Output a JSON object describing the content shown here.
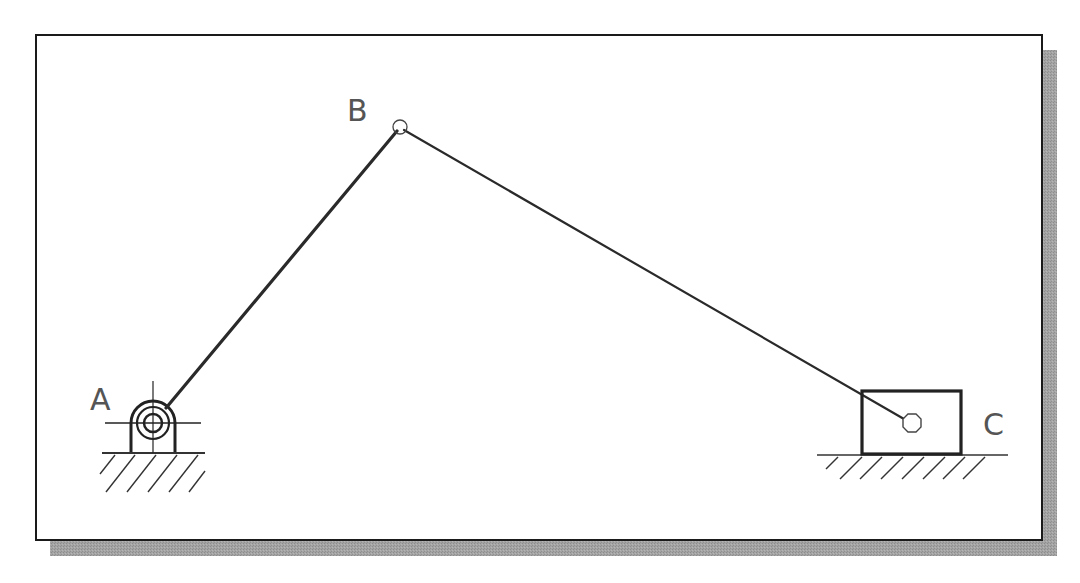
{
  "diagram": {
    "type": "slider-crank mechanism",
    "colors": {
      "frame_border": "#1a1a1a",
      "shadow": "#9a9a9a",
      "link": "#2a2a2a",
      "label": "#555555",
      "background": "#ffffff"
    },
    "frame": {
      "x": 36,
      "y": 35,
      "width": 1006,
      "height": 505,
      "shadow_offset": 15
    },
    "nodes": [
      {
        "id": "A",
        "label": "A",
        "type": "fixed-pivot",
        "x": 153,
        "y": 423,
        "label_x": 90,
        "label_y": 410
      },
      {
        "id": "B",
        "label": "B",
        "type": "pin-joint",
        "x": 400,
        "y": 127,
        "label_x": 347,
        "label_y": 121
      },
      {
        "id": "C",
        "label": "C",
        "type": "slider-joint",
        "x": 912,
        "y": 423,
        "label_x": 983,
        "label_y": 435
      }
    ],
    "links": [
      {
        "from": "A",
        "to": "B",
        "name": "crank",
        "stroke_width": 3
      },
      {
        "from": "B",
        "to": "C",
        "name": "connecting-rod",
        "stroke_width": 2
      }
    ],
    "slider_block": {
      "x": 862,
      "y": 391,
      "width": 99,
      "height": 63
    },
    "ground": [
      {
        "under": "A",
        "x1": 102,
        "x2": 205,
        "y": 453
      },
      {
        "under": "C",
        "x1": 817,
        "x2": 1008,
        "y": 455
      }
    ]
  }
}
